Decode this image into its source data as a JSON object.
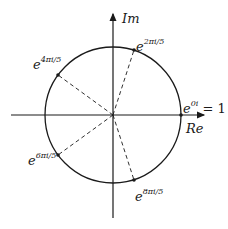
{
  "diagram": {
    "axes": {
      "x_label": "Re",
      "y_label": "Im"
    },
    "colors": {
      "stroke": "#1a1a1a",
      "background": "#ffffff"
    },
    "circle": {
      "cx": 113,
      "cy": 115,
      "r": 68
    },
    "points": [
      {
        "id": "root-0",
        "base": "e",
        "exponent": "0i",
        "suffix": " = 1",
        "angle_deg": 0
      },
      {
        "id": "root-1",
        "base": "e",
        "exponent": "2πi/5",
        "suffix": "",
        "angle_deg": 72
      },
      {
        "id": "root-2",
        "base": "e",
        "exponent": "4πi/5",
        "suffix": "",
        "angle_deg": 144
      },
      {
        "id": "root-3",
        "base": "e",
        "exponent": "6πi/5",
        "suffix": "",
        "angle_deg": 216
      },
      {
        "id": "root-4",
        "base": "e",
        "exponent": "8πi/5",
        "suffix": "",
        "angle_deg": 288
      }
    ]
  }
}
